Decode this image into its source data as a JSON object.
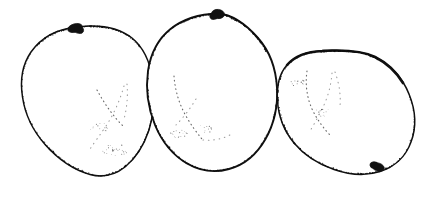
{
  "figure": {
    "background_color": "#ffffff",
    "ink_color": "#111111",
    "stipple_color": "#0d0d0d",
    "width": 438,
    "height": 199,
    "technique": "pen-and-ink stipple",
    "specimen_count": 3,
    "caption": ""
  },
  "specimens": [
    {
      "id": "specimen-left",
      "label": "left seed",
      "outline_path": "M 75.5 27.5 C 56 29 41 38 31 52 C 22 65 20 81 22.5 97 C 25 114 33 131 45.5 145 C 58 159 74 170 90 174.5 C 103 178 115 175 125 167 C 136 158 144 145 149 130 C 154 114 155 96 152.5 79 C 150 62 143 47 132 38 C 120 28.5 103 25.5 89 26 C 84.5 26.2 80 26.8 75.5 27.5 Z",
      "hilum": {
        "cx": 75,
        "cy": 28,
        "rx": 7.5,
        "ry": 4.2,
        "rotation": -16
      },
      "hilum_label": "attachment scar",
      "shade_zones": [
        "upper-left rim",
        "upper rim right of scar",
        "lower rim",
        "lower-right flank"
      ],
      "inner_arcs": 2
    },
    {
      "id": "specimen-middle",
      "label": "middle seed",
      "outline_path": "M 218 13.5 C 200 14 183 19 170.5 29 C 158 39 150.5 54 148 71 C 145.5 89 148 108 155 125 C 162 142 173.5 155.5 187 163.5 C 200 171 215 173 229 169 C 244 165 257 154 265.5 139 C 274 124 278 106 277 88 C 276 69 269.5 51 258 38 C 247 25.5 233 14.5 218 13.5 Z",
      "hilum": {
        "cx": 218,
        "cy": 14,
        "rx": 6.5,
        "ry": 4.6,
        "rotation": 6
      },
      "hilum_label": "attachment scar",
      "shade_zones": [
        "left shoulder",
        "right shoulder",
        "right flank",
        "bottom rim"
      ],
      "inner_arcs": 2
    },
    {
      "id": "specimen-right",
      "label": "right seed",
      "outline_path": "M 322 51 C 307 51.5 295 56 287 65 C 279 74 276.5 87 277.5 101 C 278.5 116 284 131 294 143 C 304 155 318 164 334 169.5 C 350 175 366 176 380 171.5 C 395 167 406 156 411 142 C 416.5 127.5 415.5 110 409 94 C 402.5 78 390 64.5 375 57 C 360 49.5 341 50.5 332 50.5 C 328.5 50.5 325 50.8 322 51 Z",
      "hilum": {
        "cx": 378,
        "cy": 167,
        "rx": 6.5,
        "ry": 4.0,
        "rotation": 18
      },
      "hilum_label": "attachment scar",
      "shade_zones": [
        "top rim",
        "upper-left rim",
        "lower-right flank",
        "bottom rim"
      ],
      "inner_arcs": 2
    }
  ]
}
